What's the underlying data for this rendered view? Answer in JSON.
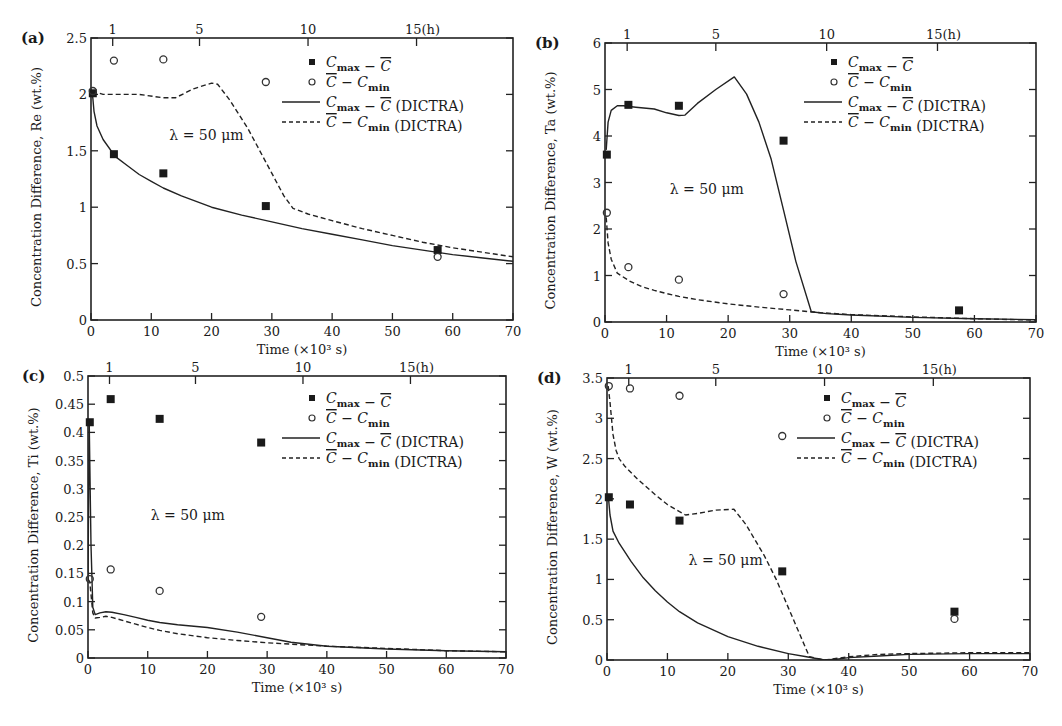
{
  "figure": {
    "common": {
      "xlabel": "Time (×10³ s)",
      "top_axis_ticks": [
        {
          "label": "1",
          "x": 3.6
        },
        {
          "label": "5",
          "x": 18
        },
        {
          "label": "10",
          "x": 36
        },
        {
          "label": "15(h)",
          "x": 54
        }
      ],
      "xticks": [
        0,
        10,
        20,
        30,
        40,
        50,
        60,
        70
      ],
      "xlim": [
        0,
        70
      ],
      "annotation": "λ = 50 μm",
      "legend": [
        {
          "marker": "filled-square",
          "label": "C_max − C̄"
        },
        {
          "marker": "open-circle",
          "label": "C̄ − C_min"
        },
        {
          "marker": "solid-line",
          "label": "C_max − C̄ (DICTRA)"
        },
        {
          "marker": "dashed-line",
          "label": "C̄ − C_min (DICTRA)"
        }
      ]
    }
  },
  "chart_data": [
    {
      "id": "a",
      "panel_label": "(a)",
      "type": "line",
      "title": "",
      "xlabel": "Time (×10³ s)",
      "ylabel": "Concentration Difference, Re (wt.%)",
      "xlim": [
        0,
        70
      ],
      "ylim": [
        0,
        2.5
      ],
      "yticks": [
        0,
        0.5,
        1,
        1.5,
        2,
        2.5
      ],
      "ytick_labels": [
        "0",
        "0.5",
        "1",
        "1.5",
        "2",
        "2.5"
      ],
      "frame": {
        "left": 91,
        "top": 38,
        "right": 513,
        "bottom": 320
      },
      "annotation": {
        "text": "λ = 50 μm",
        "x": 13,
        "y": 1.6
      },
      "legend_pos": {
        "x": 300,
        "y": 62
      },
      "series": [
        {
          "name": "C_max − C̄",
          "style": "filled-square",
          "x": [
            0.3,
            3.8,
            12,
            29,
            57.5
          ],
          "y": [
            2.01,
            1.47,
            1.3,
            1.01,
            0.62
          ]
        },
        {
          "name": "C̄ − C_min",
          "style": "open-circle",
          "x": [
            0.3,
            3.8,
            12,
            29,
            57.5
          ],
          "y": [
            2.03,
            2.3,
            2.31,
            2.11,
            0.56
          ]
        },
        {
          "name": "C_max − C̄ (DICTRA)",
          "style": "solid",
          "x": [
            0.2,
            0.5,
            1,
            2,
            4,
            6,
            8,
            10,
            12,
            15,
            20,
            25,
            30,
            35,
            40,
            45,
            50,
            55,
            60,
            65,
            70
          ],
          "y": [
            2.03,
            1.85,
            1.72,
            1.6,
            1.45,
            1.37,
            1.29,
            1.23,
            1.17,
            1.1,
            1.0,
            0.93,
            0.87,
            0.81,
            0.76,
            0.71,
            0.66,
            0.62,
            0.58,
            0.55,
            0.52
          ]
        },
        {
          "name": "C̄ − C_min (DICTRA)",
          "style": "dashed",
          "x": [
            0.2,
            2,
            5,
            8,
            12,
            14,
            17,
            20,
            21,
            23,
            26,
            28,
            30,
            32,
            33.5,
            36,
            40,
            45,
            50,
            55,
            60,
            65,
            70
          ],
          "y": [
            2.03,
            2.0,
            2.0,
            2.0,
            1.97,
            1.97,
            2.05,
            2.1,
            2.09,
            1.95,
            1.7,
            1.5,
            1.3,
            1.1,
            0.99,
            0.94,
            0.88,
            0.81,
            0.75,
            0.69,
            0.64,
            0.6,
            0.56
          ]
        }
      ]
    },
    {
      "id": "b",
      "panel_label": "(b)",
      "type": "line",
      "title": "",
      "xlabel": "Time (×10³ s)",
      "ylabel": "Concentration Difference, Ta (wt.%)",
      "xlim": [
        0,
        70
      ],
      "ylim": [
        0,
        6
      ],
      "yticks": [
        0,
        1,
        2,
        3,
        4,
        5,
        6
      ],
      "ytick_labels": [
        "0",
        "1",
        "2",
        "3",
        "4",
        "5",
        "6"
      ],
      "frame": {
        "left": 605,
        "top": 43,
        "right": 1036,
        "bottom": 322
      },
      "annotation": {
        "text": "λ = 50 μm",
        "x": 10.5,
        "y": 2.75
      },
      "legend_pos": {
        "x": 822,
        "y": 62
      },
      "series": [
        {
          "name": "C_max − C̄",
          "style": "filled-square",
          "x": [
            0.3,
            3.8,
            12,
            29,
            57.5
          ],
          "y": [
            3.6,
            4.67,
            4.65,
            3.9,
            0.25
          ]
        },
        {
          "name": "C̄ − C_min",
          "style": "open-circle",
          "x": [
            0.3,
            3.8,
            12,
            29
          ],
          "y": [
            2.35,
            1.18,
            0.91,
            0.6
          ]
        },
        {
          "name": "C_max − C̄ (DICTRA)",
          "style": "solid",
          "x": [
            0.2,
            0.5,
            1,
            2,
            3,
            5,
            8,
            10,
            12,
            13,
            15,
            18,
            21,
            23,
            25,
            27,
            29,
            31,
            33.5,
            36,
            40,
            50,
            60,
            70
          ],
          "y": [
            3.7,
            4.3,
            4.55,
            4.65,
            4.65,
            4.62,
            4.58,
            4.5,
            4.44,
            4.45,
            4.7,
            5.0,
            5.27,
            4.9,
            4.3,
            3.5,
            2.4,
            1.3,
            0.22,
            0.18,
            0.15,
            0.1,
            0.07,
            0.05
          ]
        },
        {
          "name": "C̄ − C_min (DICTRA)",
          "style": "dashed",
          "x": [
            0.2,
            0.5,
            1,
            2,
            4,
            6,
            8,
            10,
            12,
            15,
            20,
            25,
            30,
            35,
            40,
            50,
            60,
            70
          ],
          "y": [
            2.25,
            1.7,
            1.35,
            1.05,
            0.88,
            0.76,
            0.68,
            0.61,
            0.55,
            0.48,
            0.39,
            0.32,
            0.26,
            0.2,
            0.16,
            0.11,
            0.07,
            0.04
          ]
        }
      ]
    },
    {
      "id": "c",
      "panel_label": "(c)",
      "type": "line",
      "title": "",
      "xlabel": "Time (×10³ s)",
      "ylabel": "Concentration Difference, Ti (wt.%)",
      "xlim": [
        0,
        70
      ],
      "ylim": [
        0,
        0.5
      ],
      "yticks": [
        0,
        0.05,
        0.1,
        0.15,
        0.2,
        0.25,
        0.3,
        0.35,
        0.4,
        0.45,
        0.5
      ],
      "ytick_labels": [
        "0",
        "0.05",
        "0.1",
        "0.15",
        "0.2",
        "0.25",
        "0.3",
        "0.35",
        "0.4",
        "0.45",
        "0.5"
      ],
      "frame": {
        "left": 88,
        "top": 376,
        "right": 506,
        "bottom": 658
      },
      "annotation": {
        "text": "λ = 50 μm",
        "x": 10.5,
        "y": 0.245
      },
      "legend_pos": {
        "x": 300,
        "y": 398
      },
      "series": [
        {
          "name": "C_max − C̄",
          "style": "filled-square",
          "x": [
            0.3,
            3.8,
            12,
            29
          ],
          "y": [
            0.418,
            0.459,
            0.424,
            0.382
          ]
        },
        {
          "name": "C̄ − C_min",
          "style": "open-circle",
          "x": [
            0.3,
            3.8,
            12,
            29
          ],
          "y": [
            0.14,
            0.157,
            0.119,
            0.073
          ]
        },
        {
          "name": "C_max − C̄ (DICTRA)",
          "style": "solid",
          "x": [
            0,
            0.2,
            0.5,
            0.8,
            1.2,
            2,
            3,
            4,
            6,
            8,
            10,
            12,
            15,
            20,
            25,
            30,
            34,
            40,
            50,
            60,
            70
          ],
          "y": [
            0.14,
            0.42,
            0.2,
            0.09,
            0.077,
            0.08,
            0.082,
            0.081,
            0.077,
            0.072,
            0.067,
            0.063,
            0.059,
            0.054,
            0.046,
            0.036,
            0.028,
            0.021,
            0.016,
            0.013,
            0.011
          ]
        },
        {
          "name": "C̄ − C_min (DICTRA)",
          "style": "dashed",
          "x": [
            0,
            0.3,
            0.8,
            1.2,
            2,
            3,
            4,
            6,
            8,
            10,
            12,
            15,
            20,
            25,
            30,
            35,
            40,
            50,
            60,
            70
          ],
          "y": [
            0.14,
            0.135,
            0.08,
            0.071,
            0.072,
            0.074,
            0.072,
            0.066,
            0.06,
            0.054,
            0.049,
            0.043,
            0.036,
            0.031,
            0.027,
            0.024,
            0.021,
            0.017,
            0.013,
            0.011
          ]
        }
      ]
    },
    {
      "id": "d",
      "panel_label": "(d)",
      "type": "line",
      "title": "",
      "xlabel": "Time (×10³ s)",
      "ylabel": "Concentration Difference, W (wt.%)",
      "xlim": [
        0,
        70
      ],
      "ylim": [
        0,
        3.5
      ],
      "yticks": [
        0,
        0.5,
        1,
        1.5,
        2,
        2.5,
        3,
        3.5
      ],
      "ytick_labels": [
        "0",
        "0.5",
        "1",
        "1.5",
        "2",
        "2.5",
        "3",
        "3.5"
      ],
      "frame": {
        "left": 607,
        "top": 378,
        "right": 1030,
        "bottom": 660
      },
      "annotation": {
        "text": "λ = 50 μm",
        "x": 13.5,
        "y": 1.18
      },
      "legend_pos": {
        "x": 815,
        "y": 398
      },
      "series": [
        {
          "name": "C_max − C̄",
          "style": "filled-square",
          "x": [
            0.3,
            3.8,
            12,
            29,
            57.5
          ],
          "y": [
            2.02,
            1.93,
            1.73,
            1.1,
            0.6
          ]
        },
        {
          "name": "C̄ − C_min",
          "style": "open-circle",
          "x": [
            0.3,
            3.8,
            12,
            29,
            57.5
          ],
          "y": [
            3.4,
            3.37,
            3.28,
            2.78,
            0.51
          ]
        },
        {
          "name": "C_max − C̄ (DICTRA)",
          "style": "solid",
          "x": [
            0.2,
            0.5,
            1,
            2,
            4,
            6,
            8,
            10,
            12,
            15,
            20,
            25,
            30,
            33,
            36,
            38,
            40,
            45,
            50,
            60,
            70
          ],
          "y": [
            2.05,
            1.8,
            1.6,
            1.45,
            1.22,
            1.02,
            0.86,
            0.72,
            0.6,
            0.46,
            0.29,
            0.17,
            0.08,
            0.04,
            0.0,
            0.01,
            0.03,
            0.05,
            0.07,
            0.08,
            0.08
          ]
        },
        {
          "name": "C̄ − C_min (DICTRA)",
          "style": "dashed",
          "x": [
            0.2,
            0.5,
            1,
            1.5,
            2,
            3,
            5,
            8,
            10,
            12,
            13,
            15,
            18,
            21,
            23,
            26,
            28,
            30,
            32,
            33.5,
            36,
            40,
            45,
            50,
            60,
            70
          ],
          "y": [
            3.4,
            3.2,
            2.8,
            2.6,
            2.5,
            2.4,
            2.25,
            2.05,
            1.93,
            1.84,
            1.8,
            1.82,
            1.86,
            1.87,
            1.68,
            1.3,
            1.0,
            0.65,
            0.3,
            0.04,
            0.0,
            0.04,
            0.07,
            0.08,
            0.09,
            0.09
          ]
        }
      ]
    }
  ]
}
